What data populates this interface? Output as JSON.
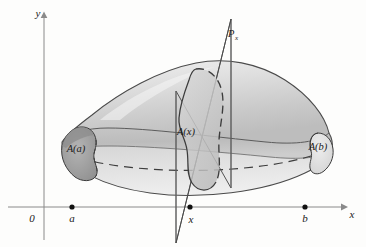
{
  "figure": {
    "type": "math-solid-cross-section-diagram",
    "title_visible": false,
    "background_color": "#fdfdfc",
    "ink_color": "#1a1a1a",
    "axis_color": "#8a8a8a"
  },
  "axes": {
    "x_axis": {
      "label": "x",
      "label_x": 352,
      "label_y": 218,
      "arrow": true,
      "y_position": 207,
      "x_start": 8,
      "x_end": 345
    },
    "y_axis": {
      "label": "y",
      "label_x": 38,
      "label_y": 17,
      "arrow": true,
      "x_position": 44,
      "y_start": 14,
      "y_end": 240
    },
    "origin_label": "0",
    "origin_label_x": 32,
    "origin_label_y": 222
  },
  "ticks": [
    {
      "name": "a",
      "label": "a",
      "x": 72,
      "y": 207,
      "label_y": 222,
      "dot": true
    },
    {
      "name": "x",
      "label": "x",
      "x": 190,
      "y": 207,
      "label_y": 223,
      "dot": true
    },
    {
      "name": "b",
      "label": "b",
      "x": 305,
      "y": 207,
      "label_y": 222,
      "dot": true
    }
  ],
  "solid": {
    "name": "solid-body",
    "description": "three-dimensional solid with irregular cross-sections",
    "upper_fill": "#dcdcdc",
    "lower_fill": "#c4c4c4",
    "outline_color": "#3c3c3c"
  },
  "cross_sections": [
    {
      "name": "cross-section-a",
      "label": "A(a)",
      "label_x": 76,
      "label_y": 152,
      "fill": "#a8a8a8",
      "position": "left-end"
    },
    {
      "name": "cross-section-x",
      "label": "A(x)",
      "label_x": 186,
      "label_y": 135,
      "fill": "#cfcfcf",
      "position": "middle"
    },
    {
      "name": "cross-section-b",
      "label": "A(b)",
      "label_x": 318,
      "label_y": 150,
      "fill": "#e2e2e2",
      "position": "right-end"
    }
  ],
  "plane": {
    "name": "cutting-plane",
    "label_main": "P",
    "label_sub": "x",
    "label_x": 231,
    "label_y": 37,
    "description": "vertical cutting plane perpendicular to the x-axis at x",
    "outline_color": "#4a4a4a"
  }
}
